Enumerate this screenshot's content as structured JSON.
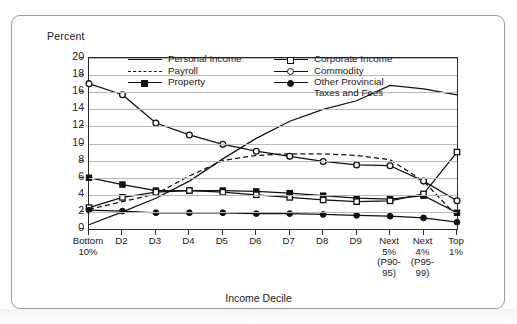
{
  "axes": {
    "ylabel": "Percent",
    "xlabel": "Income Decile",
    "yticks": [
      "20",
      "18",
      "16",
      "14",
      "12",
      "10",
      "8",
      "6",
      "4",
      "2",
      "0"
    ],
    "xticklabels": [
      "Bottom\n10%",
      "D2",
      "D3",
      "D4",
      "D5",
      "D6",
      "D7",
      "D8",
      "D9",
      "Next\n5%\n(P90-\n95)",
      "Next\n4%\n(P95-\n99)",
      "Top\n1%"
    ]
  },
  "legend": {
    "left": [
      {
        "label": "Personal Income",
        "key": "solid"
      },
      {
        "label": "Payroll",
        "key": "dashed"
      },
      {
        "label": "Property",
        "key": "line-filled-square"
      }
    ],
    "right": [
      {
        "label": "Corporate Income",
        "key": "line-open-square"
      },
      {
        "label": "Commodity",
        "key": "line-open-circle"
      },
      {
        "label": "Other Provincial\nTaxes and Fees",
        "key": "line-filled-circle"
      }
    ]
  },
  "chart_data": {
    "type": "line",
    "title": "",
    "xlabel": "Income Decile",
    "ylabel": "Percent",
    "ylim": [
      0,
      20
    ],
    "ytick_step": 2,
    "grid": true,
    "legend_position": "top-center-inside",
    "categories": [
      "Bottom 10%",
      "D2",
      "D3",
      "D4",
      "D5",
      "D6",
      "D7",
      "D8",
      "D9",
      "Next 5% (P90-95)",
      "Next 4% (P95-99)",
      "Top 1%"
    ],
    "series": [
      {
        "name": "Personal Income",
        "marker": "none",
        "style": "solid",
        "values": [
          0.5,
          2.0,
          3.6,
          5.6,
          8.2,
          10.6,
          12.6,
          14.0,
          15.0,
          16.8,
          16.4,
          15.7
        ]
      },
      {
        "name": "Payroll",
        "marker": "none",
        "style": "dashed",
        "values": [
          2.3,
          3.2,
          4.1,
          6.2,
          8.0,
          8.6,
          8.8,
          8.8,
          8.6,
          8.1,
          5.6,
          1.5
        ]
      },
      {
        "name": "Property",
        "marker": "filled-square",
        "style": "solid",
        "values": [
          6.0,
          5.2,
          4.5,
          4.5,
          4.5,
          4.4,
          4.2,
          3.9,
          3.6,
          3.5,
          3.9,
          1.9
        ]
      },
      {
        "name": "Corporate Income",
        "marker": "open-square",
        "style": "solid",
        "values": [
          2.5,
          3.7,
          4.3,
          4.5,
          4.3,
          4.0,
          3.7,
          3.4,
          3.2,
          3.3,
          4.1,
          9.0
        ]
      },
      {
        "name": "Commodity",
        "marker": "open-circle",
        "style": "solid",
        "values": [
          17.0,
          15.7,
          12.4,
          11.0,
          9.9,
          9.1,
          8.5,
          7.9,
          7.5,
          7.4,
          5.6,
          3.3
        ]
      },
      {
        "name": "Other Provincial Taxes and Fees",
        "marker": "filled-circle",
        "style": "solid",
        "values": [
          2.2,
          2.1,
          1.9,
          1.9,
          1.9,
          1.8,
          1.8,
          1.7,
          1.6,
          1.5,
          1.3,
          0.8
        ]
      }
    ]
  }
}
